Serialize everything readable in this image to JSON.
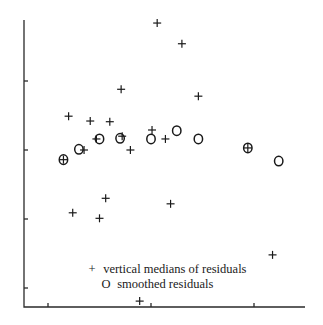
{
  "chart_data": {
    "type": "scatter",
    "title": "",
    "xlabel": "",
    "ylabel": "",
    "x_ticks": [
      1,
      2,
      3
    ],
    "y_ticks": [
      -2,
      -1,
      0,
      1
    ],
    "tick_labels_shown": false,
    "xlim": [
      0.77,
      3.52
    ],
    "ylim": [
      -2.28,
      1.88
    ],
    "grid": false,
    "legend_position": "lower center (inside plot)",
    "series": [
      {
        "name": "vertical medians of residuals",
        "marker": "+",
        "points": [
          {
            "x": 2.06,
            "y": 1.84
          },
          {
            "x": 2.3,
            "y": 1.54
          },
          {
            "x": 1.71,
            "y": 0.88
          },
          {
            "x": 2.46,
            "y": 0.78
          },
          {
            "x": 1.2,
            "y": 0.49
          },
          {
            "x": 1.41,
            "y": 0.42
          },
          {
            "x": 1.6,
            "y": 0.41
          },
          {
            "x": 2.01,
            "y": 0.29
          },
          {
            "x": 1.72,
            "y": 0.2
          },
          {
            "x": 1.47,
            "y": 0.16
          },
          {
            "x": 2.14,
            "y": 0.16
          },
          {
            "x": 1.35,
            "y": 0.0
          },
          {
            "x": 1.8,
            "y": 0.0
          },
          {
            "x": 1.15,
            "y": -0.14
          },
          {
            "x": 1.56,
            "y": -0.7
          },
          {
            "x": 1.24,
            "y": -0.91
          },
          {
            "x": 1.5,
            "y": -0.99
          },
          {
            "x": 2.19,
            "y": -0.78
          },
          {
            "x": 3.18,
            "y": -1.52
          },
          {
            "x": 1.89,
            "y": -2.19
          },
          {
            "x": 2.94,
            "y": 0.03
          }
        ]
      },
      {
        "name": "smoothed residuals",
        "marker": "O",
        "points": [
          {
            "x": 1.15,
            "y": -0.14
          },
          {
            "x": 1.3,
            "y": 0.01
          },
          {
            "x": 1.5,
            "y": 0.16
          },
          {
            "x": 1.7,
            "y": 0.17
          },
          {
            "x": 2.0,
            "y": 0.16
          },
          {
            "x": 2.25,
            "y": 0.28
          },
          {
            "x": 2.46,
            "y": 0.16
          },
          {
            "x": 2.94,
            "y": 0.03
          },
          {
            "x": 3.24,
            "y": -0.16
          }
        ]
      }
    ]
  },
  "legend": {
    "items": [
      {
        "symbol": "+",
        "label": "vertical medians of residuals"
      },
      {
        "symbol": "O",
        "label": "smoothed residuals"
      }
    ]
  },
  "layout_px": {
    "x_origin_px": 48,
    "x_unit_px": 103,
    "y_zero_px": 150,
    "y_unit_px": 69,
    "axis_left": 24,
    "axis_right": 305,
    "axis_top": 20,
    "axis_bottom": 307
  }
}
